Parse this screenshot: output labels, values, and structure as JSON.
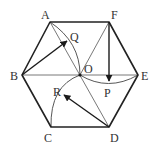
{
  "figure": {
    "colors": {
      "stroke": "#222222",
      "thin": "#555555",
      "label": "#333333",
      "background": "#ffffff"
    },
    "vertices": {
      "A": {
        "label": "A",
        "x": 50,
        "y": 22
      },
      "F": {
        "label": "F",
        "x": 109,
        "y": 22
      },
      "E": {
        "label": "E",
        "x": 138,
        "y": 75
      },
      "D": {
        "label": "D",
        "x": 109,
        "y": 127
      },
      "C": {
        "label": "C",
        "x": 51,
        "y": 127
      },
      "B": {
        "label": "B",
        "x": 22,
        "y": 75
      }
    },
    "points": {
      "O": {
        "label": "O",
        "x": 80,
        "y": 75
      },
      "Q": {
        "label": "Q",
        "x": 68,
        "y": 40
      },
      "P": {
        "label": "P",
        "x": 109,
        "y": 82
      },
      "R": {
        "label": "R",
        "x": 63,
        "y": 95
      }
    },
    "vectors": [
      {
        "name": "vector-BQ",
        "from": "B",
        "to": "Q"
      },
      {
        "name": "vector-FP",
        "from": "F",
        "to": "P"
      },
      {
        "name": "vector-DR",
        "from": "D",
        "to": "R"
      }
    ],
    "diagonals": [
      "AD",
      "FC",
      "BE"
    ],
    "arcs": [
      {
        "name": "arc-AO-through-Q",
        "center": "B"
      },
      {
        "name": "arc-OE-through-P",
        "center": "F"
      },
      {
        "name": "arc-CO-through-R",
        "center": "D"
      }
    ]
  }
}
